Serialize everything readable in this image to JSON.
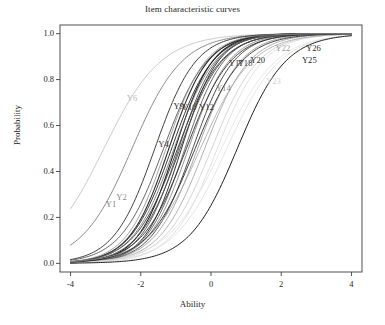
{
  "figure": {
    "title": "Item characteristic curves",
    "xlabel": "Ability",
    "ylabel": "Probability"
  },
  "axes": {
    "xticks": [
      "-4",
      "-2",
      "0",
      "2",
      "4"
    ],
    "yticks": [
      "0.0",
      "0.2",
      "0.4",
      "0.6",
      "0.8",
      "1.0"
    ]
  },
  "chart_data": {
    "type": "line",
    "title": "Item characteristic curves",
    "xlabel": "Ability",
    "ylabel": "Probability",
    "xlim": [
      -4,
      4
    ],
    "ylim": [
      0,
      1
    ],
    "xticks": [
      -4,
      -2,
      0,
      2,
      4
    ],
    "yticks": [
      0.0,
      0.2,
      0.4,
      0.6,
      0.8,
      1.0
    ],
    "grid": false,
    "legend": "none",
    "annotations": [
      {
        "text": "Y6",
        "x": -2.25,
        "y": 0.705,
        "color": "#b9b9b9"
      },
      {
        "text": "Y4",
        "x": -1.35,
        "y": 0.505,
        "color": "#3a3a3a"
      },
      {
        "text": "Y1",
        "x": -2.85,
        "y": 0.245,
        "color": "#7a7a7a"
      },
      {
        "text": "Y2",
        "x": -2.55,
        "y": 0.275,
        "color": "#8d8d8d"
      },
      {
        "text": "Y9",
        "x": -0.92,
        "y": 0.672,
        "color": "#2a2a2a"
      },
      {
        "text": "Y10",
        "x": -0.62,
        "y": 0.668,
        "color": "#4a4a4a"
      },
      {
        "text": "Y12",
        "x": -0.13,
        "y": 0.668,
        "color": "#3a3a3a"
      },
      {
        "text": "Y14",
        "x": 0.35,
        "y": 0.752,
        "color": "#8a8a8a"
      },
      {
        "text": "Y17",
        "x": 0.72,
        "y": 0.861,
        "color": "#3a3a3a"
      },
      {
        "text": "Y18",
        "x": 0.97,
        "y": 0.861,
        "color": "#3a3a3a"
      },
      {
        "text": "Y20",
        "x": 1.33,
        "y": 0.872,
        "color": "#2f2f2f"
      },
      {
        "text": "Y23",
        "x": 1.78,
        "y": 0.782,
        "color": "#d2d2d2"
      },
      {
        "text": "Y22",
        "x": 2.05,
        "y": 0.925,
        "color": "#9a9a9a"
      },
      {
        "text": "Y26",
        "x": 2.92,
        "y": 0.926,
        "color": "#2a2a2a"
      },
      {
        "text": "Y25",
        "x": 2.8,
        "y": 0.872,
        "color": "#1a1a1a"
      }
    ],
    "series": [
      {
        "name": "Y6",
        "discrimination": 0.72,
        "difficulty": -3.05,
        "color": "#bdbdbd",
        "width": 0.8
      },
      {
        "name": "Y5",
        "discrimination": 0.82,
        "difficulty": -2.25,
        "color": "#6f6f6f",
        "width": 0.8
      },
      {
        "name": "Y4",
        "discrimination": 1.0,
        "difficulty": -1.6,
        "color": "#3f3f3f",
        "width": 1.0
      },
      {
        "name": "Y7",
        "discrimination": 0.95,
        "difficulty": -1.35,
        "color": "#555555",
        "width": 0.9
      },
      {
        "name": "Y1",
        "discrimination": 1.05,
        "difficulty": -1.2,
        "color": "#2b2b2b",
        "width": 1.1
      },
      {
        "name": "Y2",
        "discrimination": 1.0,
        "difficulty": -1.12,
        "color": "#3a3a3a",
        "width": 1.0
      },
      {
        "name": "Y3",
        "discrimination": 1.1,
        "difficulty": -1.02,
        "color": "#202020",
        "width": 1.1
      },
      {
        "name": "Y8",
        "discrimination": 1.08,
        "difficulty": -0.92,
        "color": "#4a4a4a",
        "width": 0.9
      },
      {
        "name": "Y9",
        "discrimination": 1.12,
        "difficulty": -0.84,
        "color": "#2f2f2f",
        "width": 1.0
      },
      {
        "name": "Y10",
        "discrimination": 1.06,
        "difficulty": -0.74,
        "color": "#5c5c5c",
        "width": 0.9
      },
      {
        "name": "Y11",
        "discrimination": 1.02,
        "difficulty": -0.64,
        "color": "#7a7a7a",
        "width": 0.8
      },
      {
        "name": "Y12",
        "discrimination": 1.0,
        "difficulty": -0.52,
        "color": "#3a3a3a",
        "width": 0.9
      },
      {
        "name": "Y13",
        "discrimination": 0.96,
        "difficulty": -0.38,
        "color": "#909090",
        "width": 0.8
      },
      {
        "name": "Y14",
        "discrimination": 0.92,
        "difficulty": -0.18,
        "color": "#9a9a9a",
        "width": 0.8
      },
      {
        "name": "Y15",
        "discrimination": 0.88,
        "difficulty": 0.02,
        "color": "#c8c8c8",
        "width": 0.8
      },
      {
        "name": "Y16",
        "discrimination": 0.9,
        "difficulty": 0.18,
        "color": "#d8d8d8",
        "width": 0.8
      },
      {
        "name": "Y17",
        "discrimination": 0.95,
        "difficulty": -0.95,
        "color": "#353535",
        "width": 0.9
      },
      {
        "name": "Y18",
        "discrimination": 0.98,
        "difficulty": -0.88,
        "color": "#454545",
        "width": 0.9
      },
      {
        "name": "Y20",
        "discrimination": 0.93,
        "difficulty": -0.7,
        "color": "#2a2a2a",
        "width": 0.9
      },
      {
        "name": "Y22",
        "discrimination": 0.8,
        "difficulty": -0.3,
        "color": "#a5a5a5",
        "width": 0.8
      },
      {
        "name": "Y23",
        "discrimination": 0.78,
        "difficulty": 0.45,
        "color": "#dcdcdc",
        "width": 0.8
      },
      {
        "name": "Y24",
        "discrimination": 0.76,
        "difficulty": 0.3,
        "color": "#e2e2e2",
        "width": 0.8
      },
      {
        "name": "Y25",
        "discrimination": 0.85,
        "difficulty": 0.75,
        "color": "#1f1f1f",
        "width": 1.0
      },
      {
        "name": "Y26",
        "discrimination": 0.88,
        "difficulty": -0.45,
        "color": "#2a2a2a",
        "width": 0.9
      },
      {
        "name": "Y19",
        "discrimination": 1.0,
        "difficulty": -1.05,
        "color": "#6a6a6a",
        "width": 0.8
      },
      {
        "name": "Y21",
        "discrimination": 1.04,
        "difficulty": -1.28,
        "color": "#8a8a8a",
        "width": 0.8
      }
    ]
  },
  "plot_box": {
    "left": 60,
    "top": 25,
    "right": 362,
    "bottom": 272
  }
}
